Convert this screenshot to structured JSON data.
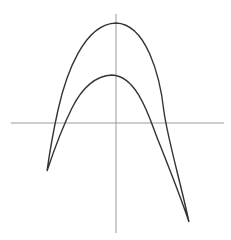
{
  "diagram": {
    "type": "plane-curve",
    "colors": {
      "background": "#ffffff",
      "axis": "#9a9a9a",
      "curve": "#333333"
    },
    "axes": {
      "horizontal": {
        "x1": 11,
        "y1": 123,
        "x2": 224,
        "y2": 123
      },
      "vertical": {
        "x1": 116,
        "y1": 14,
        "x2": 116,
        "y2": 233
      }
    },
    "curve": {
      "outer_arc_peak": [
        116,
        23
      ],
      "inner_arc_peak": [
        112,
        75
      ],
      "left_cusp": [
        47,
        171
      ],
      "right_cusp": [
        189,
        222
      ]
    }
  }
}
